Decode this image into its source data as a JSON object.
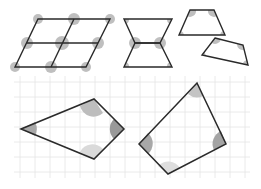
{
  "diagram": {
    "title": "",
    "colors": {
      "stroke": "#2a2a2a",
      "grid": "#e2e2e2",
      "angle_dark": "#9a9a9a",
      "angle_mid": "#b4b4b4",
      "angle_light": "#d8d8d8"
    },
    "top_shapes": [
      {
        "name": "parallelogram-tiling",
        "description": "Parallelogram divided into four congruent parallelograms with angles marked at meeting vertices"
      },
      {
        "name": "hourglass-trapezoids",
        "description": "Two trapezoids joined at short base forming an hourglass, angles marked"
      },
      {
        "name": "trapezoid",
        "description": "Single trapezoid with four angles marked"
      },
      {
        "name": "rotated-quadrilateral",
        "description": "Rotated quadrilateral with four angles marked"
      }
    ],
    "grid_shapes": [
      {
        "name": "kite",
        "description": "Kite quadrilateral on square grid with angles marked"
      },
      {
        "name": "irregular-quadrilateral",
        "description": "Irregular quadrilateral on square grid with angles marked"
      }
    ]
  }
}
